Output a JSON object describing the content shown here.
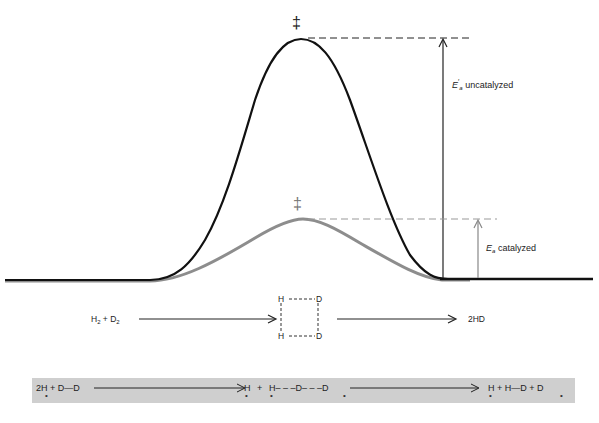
{
  "diagram": {
    "type": "reaction energy profile",
    "curves": [
      {
        "name": "uncatalyzed",
        "color": "#111111",
        "peak_label": "‡"
      },
      {
        "name": "catalyzed",
        "color": "#8a8a8a",
        "peak_label": "‡"
      }
    ],
    "labels": {
      "ea_uncat_symbol": "E",
      "ea_uncat_prime": "′",
      "ea_uncat_sub": "a",
      "ea_uncat_text": "uncatalyzed",
      "ea_cat_symbol": "E",
      "ea_cat_sub": "a",
      "ea_cat_text": "catalyzed",
      "ts_uncat": "‡",
      "ts_cat": "‡"
    },
    "reaction": {
      "reactant_h": "H",
      "reactant_h_sub": "2",
      "plus": "+",
      "reactant_d": "D",
      "reactant_d_sub": "2",
      "complex": {
        "tl": "H",
        "tr": "D",
        "bl": "H",
        "br": "D"
      },
      "product": "2HD"
    },
    "catalyzed_mechanism": {
      "step1": "2H + D—D",
      "step2_h": "H",
      "step2_plus": "+",
      "step2_chain": "H– – –D– – –D",
      "step3": "H + H—D + D",
      "surface_marker": "•"
    }
  }
}
